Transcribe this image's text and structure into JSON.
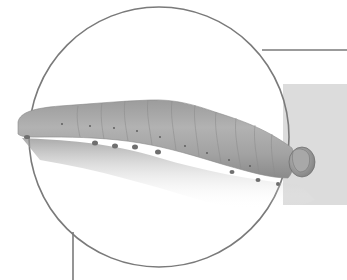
{
  "illustration": {
    "subject": "caterpillar",
    "colors": {
      "background": "#ffffff",
      "panel": "#dcdcdc",
      "circle_stroke": "#7a7a7a",
      "body_light": "#a9a9a9",
      "body_dark": "#7d7d7d",
      "shadow": "#9a9a9a"
    }
  }
}
